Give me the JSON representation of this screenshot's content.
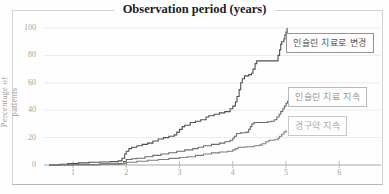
{
  "figure": {
    "background": "#fefefe",
    "frame_color": "#d2d2d2"
  },
  "chart_data": {
    "type": "line",
    "step": true,
    "title": "Observation period (years)",
    "xlabel": "Observation period (years)",
    "ylabel": "Percentage of patients",
    "xlim": [
      0,
      6.6
    ],
    "ylim": [
      0,
      100
    ],
    "xticks": [
      1,
      2,
      3,
      4,
      5,
      6
    ],
    "yticks": [
      0,
      20,
      40,
      60,
      80,
      100
    ],
    "grid": "horizontal",
    "grid_color": "#ebebeb",
    "baseline_color": "#a8a8a8",
    "legend_position": "right-inline-boxes",
    "series": [
      {
        "name": "인슐린 치료로 변경",
        "color": "#4f4f4f",
        "points": [
          [
            0.55,
            0
          ],
          [
            0.75,
            0.5
          ],
          [
            0.9,
            1
          ],
          [
            1.1,
            1.5
          ],
          [
            1.3,
            2
          ],
          [
            1.5,
            2.2
          ],
          [
            1.7,
            2.5
          ],
          [
            1.85,
            3
          ],
          [
            1.92,
            5
          ],
          [
            1.97,
            8
          ],
          [
            2.0,
            10
          ],
          [
            2.05,
            12
          ],
          [
            2.1,
            13
          ],
          [
            2.2,
            14
          ],
          [
            2.3,
            15
          ],
          [
            2.4,
            16
          ],
          [
            2.5,
            17.5
          ],
          [
            2.6,
            19
          ],
          [
            2.7,
            20
          ],
          [
            2.8,
            21
          ],
          [
            2.9,
            22
          ],
          [
            2.95,
            24
          ],
          [
            3.0,
            26
          ],
          [
            3.05,
            28
          ],
          [
            3.1,
            29
          ],
          [
            3.2,
            31
          ],
          [
            3.3,
            32
          ],
          [
            3.4,
            33
          ],
          [
            3.5,
            35
          ],
          [
            3.55,
            36
          ],
          [
            3.65,
            37
          ],
          [
            3.75,
            38
          ],
          [
            3.85,
            39
          ],
          [
            3.95,
            41
          ],
          [
            4.0,
            43
          ],
          [
            4.05,
            46
          ],
          [
            4.08,
            50
          ],
          [
            4.12,
            55
          ],
          [
            4.15,
            60
          ],
          [
            4.18,
            63
          ],
          [
            4.22,
            65
          ],
          [
            4.3,
            66
          ],
          [
            4.35,
            67
          ],
          [
            4.38,
            70
          ],
          [
            4.42,
            74
          ],
          [
            4.45,
            76
          ],
          [
            4.82,
            76
          ],
          [
            4.85,
            80
          ],
          [
            4.88,
            84
          ],
          [
            4.9,
            88
          ],
          [
            4.92,
            90
          ],
          [
            4.96,
            92
          ],
          [
            4.98,
            95
          ],
          [
            5.0,
            97
          ],
          [
            5.02,
            100
          ]
        ]
      },
      {
        "name": "인슐린 치료 지속",
        "color": "#6b6b6b",
        "points": [
          [
            0.55,
            0
          ],
          [
            1.0,
            0.3
          ],
          [
            1.5,
            0.8
          ],
          [
            1.85,
            1
          ],
          [
            1.95,
            2.5
          ],
          [
            2.0,
            4
          ],
          [
            2.1,
            4.5
          ],
          [
            2.2,
            5
          ],
          [
            2.35,
            6
          ],
          [
            2.5,
            7
          ],
          [
            2.65,
            8
          ],
          [
            2.8,
            9
          ],
          [
            2.95,
            10
          ],
          [
            3.1,
            11
          ],
          [
            3.25,
            12
          ],
          [
            3.35,
            13
          ],
          [
            3.45,
            14
          ],
          [
            3.6,
            15
          ],
          [
            3.75,
            16
          ],
          [
            3.85,
            17
          ],
          [
            3.95,
            18
          ],
          [
            4.0,
            19.5
          ],
          [
            4.03,
            21
          ],
          [
            4.07,
            23
          ],
          [
            4.15,
            23.5
          ],
          [
            4.25,
            24
          ],
          [
            4.3,
            26
          ],
          [
            4.33,
            28
          ],
          [
            4.36,
            30
          ],
          [
            4.4,
            31
          ],
          [
            4.65,
            31.5
          ],
          [
            4.72,
            32
          ],
          [
            4.78,
            33
          ],
          [
            4.83,
            35
          ],
          [
            4.87,
            37
          ],
          [
            4.9,
            39
          ],
          [
            4.94,
            41
          ],
          [
            4.97,
            43
          ],
          [
            5.0,
            45
          ],
          [
            5.03,
            47
          ]
        ]
      },
      {
        "name": "경구약 지속",
        "color": "#7d7d7d",
        "points": [
          [
            0.55,
            0
          ],
          [
            1.0,
            0.2
          ],
          [
            1.5,
            0.5
          ],
          [
            1.9,
            1
          ],
          [
            2.0,
            2
          ],
          [
            2.2,
            2.8
          ],
          [
            2.4,
            3.5
          ],
          [
            2.6,
            4
          ],
          [
            2.8,
            4.8
          ],
          [
            3.0,
            5.5
          ],
          [
            3.15,
            6
          ],
          [
            3.3,
            7
          ],
          [
            3.45,
            8
          ],
          [
            3.6,
            8.8
          ],
          [
            3.75,
            9.5
          ],
          [
            3.9,
            10
          ],
          [
            4.0,
            11
          ],
          [
            4.05,
            12
          ],
          [
            4.1,
            13
          ],
          [
            4.25,
            13.3
          ],
          [
            4.4,
            14
          ],
          [
            4.5,
            14.5
          ],
          [
            4.55,
            15.5
          ],
          [
            4.62,
            17
          ],
          [
            4.68,
            18
          ],
          [
            4.78,
            18.5
          ],
          [
            4.85,
            19.5
          ],
          [
            4.88,
            21
          ],
          [
            4.92,
            22.5
          ],
          [
            4.96,
            24
          ],
          [
            5.0,
            25.5
          ]
        ]
      }
    ]
  }
}
